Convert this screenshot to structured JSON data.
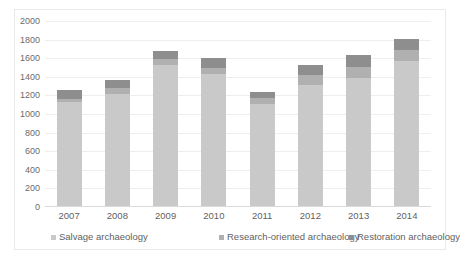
{
  "chart_data": {
    "type": "bar",
    "subtype": "stacked-vertical",
    "title": "",
    "xlabel": "",
    "ylabel": "",
    "ylim": [
      0,
      2000
    ],
    "ytick_step": 200,
    "yticks": [
      "2000",
      "1800",
      "1600",
      "1400",
      "1200",
      "1000",
      "800",
      "600",
      "400",
      "200",
      "0"
    ],
    "grid": true,
    "legend_position": "bottom",
    "categories": [
      "2007",
      "2008",
      "2009",
      "2010",
      "2011",
      "2012",
      "2013",
      "2014"
    ],
    "series": [
      {
        "name": "Salvage archaeology",
        "color": "#c9c9c9",
        "values": [
          1125,
          1210,
          1530,
          1425,
          1110,
          1310,
          1390,
          1570
        ]
      },
      {
        "name": "Research-oriented archaeology",
        "color": "#b0b0b0",
        "values": [
          40,
          75,
          60,
          65,
          60,
          105,
          115,
          115
        ]
      },
      {
        "name": "Restoration archaeology",
        "color": "#8e8e8e",
        "values": [
          90,
          85,
          90,
          110,
          65,
          115,
          125,
          125
        ]
      }
    ],
    "totals": [
      1255,
      1370,
      1680,
      1600,
      1235,
      1530,
      1630,
      1810
    ]
  }
}
